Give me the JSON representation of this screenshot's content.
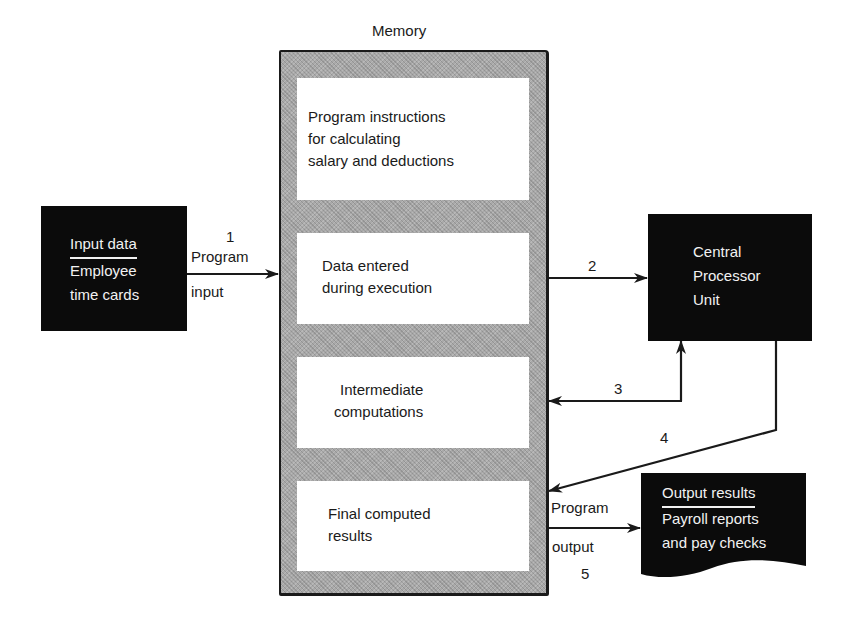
{
  "memory": {
    "title": "Memory",
    "slots": [
      {
        "lines": [
          "Program instructions",
          "for calculating",
          "salary and deductions"
        ]
      },
      {
        "lines": [
          "Data entered",
          "during execution"
        ]
      },
      {
        "lines": [
          "Intermediate",
          "computations"
        ]
      },
      {
        "lines": [
          "Final computed",
          "results"
        ]
      }
    ]
  },
  "input": {
    "heading": "Input data",
    "lines": [
      "Employee",
      "time cards"
    ]
  },
  "cpu": {
    "lines": [
      "Central",
      "Processor",
      "Unit"
    ]
  },
  "output": {
    "heading": "Output results",
    "lines": [
      "Payroll reports",
      "and pay checks"
    ]
  },
  "arrows": [
    {
      "step": "1",
      "label_top": "Program",
      "label_bottom": "input",
      "from": "input",
      "to": "memory"
    },
    {
      "step": "2",
      "from": "memory",
      "to": "cpu"
    },
    {
      "step": "3",
      "from": "cpu",
      "to": "memory",
      "bidirectional": true
    },
    {
      "step": "4",
      "from": "cpu",
      "to": "memory"
    },
    {
      "step": "5",
      "label_top": "Program",
      "label_bottom": "output",
      "from": "memory",
      "to": "output"
    }
  ],
  "colors": {
    "ink": "#1a1a1a",
    "box_fill": "#0b0b0b",
    "memory_fill": "#a9a9a9",
    "paper": "#ffffff"
  }
}
